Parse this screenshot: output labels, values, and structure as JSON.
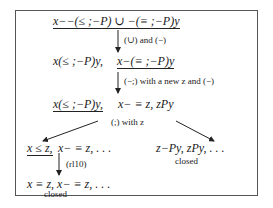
{
  "diagram": {
    "root": {
      "formula": "x−−(≤ ;−P) ∪ −(≡ ;−P)y",
      "underlined": true
    },
    "step1": {
      "rule": "(∪) and (−)",
      "left": "x(≤ ;−P)y,",
      "right": "x−(≡ ;−P)y",
      "right_underlined": true
    },
    "step2": {
      "rule": "(−;) with a new z and (−)",
      "left": "x(≤ ;−P)y,",
      "left_underlined": true,
      "right": "x− ≡ z, zPy"
    },
    "step3": {
      "rule": "(;) with z",
      "branch_left": {
        "head": "x ≤ z,",
        "head_underlined": true,
        "rest": "x− ≡ z, . . ."
      },
      "branch_right": {
        "formula": "z−Py, zPy, . . .",
        "status": "closed"
      }
    },
    "step4": {
      "rule": "(rl10)",
      "formula": "x ≡ z, x− ≡ z, . . .",
      "status": "closed"
    }
  }
}
